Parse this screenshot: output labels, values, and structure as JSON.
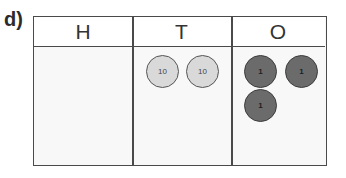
{
  "question_label": "d)",
  "place_value_chart": {
    "columns": [
      {
        "header": "H",
        "counters": []
      },
      {
        "header": "T",
        "counters": [
          {
            "value": "10"
          },
          {
            "value": "10"
          }
        ]
      },
      {
        "header": "O",
        "counters": [
          {
            "value": "1"
          },
          {
            "value": "1"
          },
          {
            "value": "1"
          }
        ]
      }
    ]
  },
  "colors": {
    "ten_counter_fill": "#d9d9d9",
    "one_counter_fill": "#6b6b6b",
    "grid_line": "#4a4a4a"
  }
}
